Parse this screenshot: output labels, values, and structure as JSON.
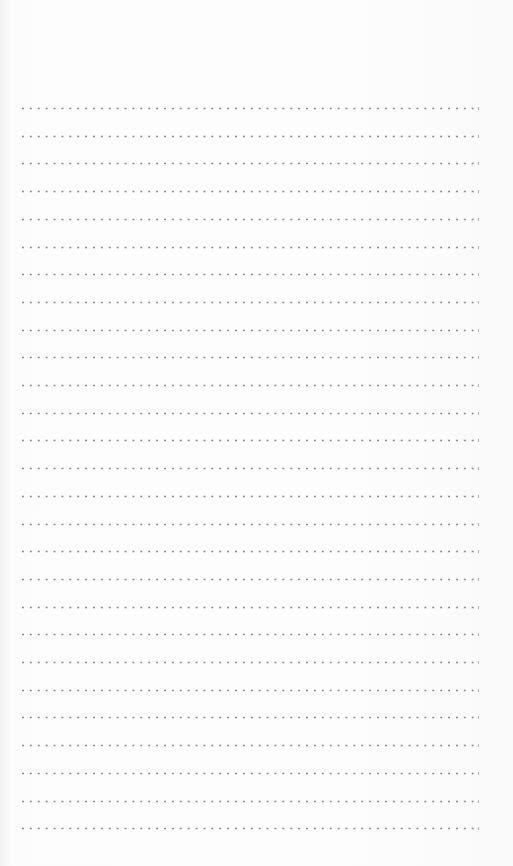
{
  "page": {
    "type": "dotted-line writing sheet",
    "line_count": 27,
    "first_line_y": 108,
    "line_spacing": 27.7,
    "dot_color": "#8c8c8c",
    "background_color": "#fbfbfb"
  }
}
